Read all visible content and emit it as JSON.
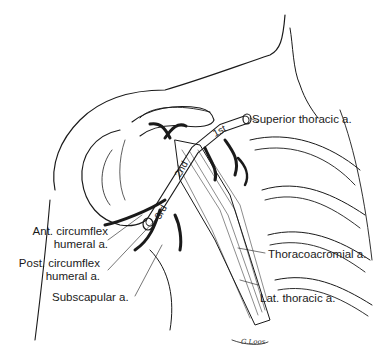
{
  "figure": {
    "labels": {
      "superior_thoracic": "Superior thoracic a.",
      "ant_circumflex_1": "Ant. circumflex",
      "ant_circumflex_2": "humeral a.",
      "post_circumflex_1": "Post. circumflex",
      "post_circumflex_2": "humeral a.",
      "subscapular": "Subscapular a.",
      "thoracoacromial": "Thoracoacromial a.",
      "lat_thoracic": "Lat. thoracic a."
    },
    "segments": {
      "first": "1st",
      "second": "2nd",
      "third": "3rd"
    },
    "signature": "G.Loos",
    "colors": {
      "ink": "#1a1a1a",
      "background": "#ffffff"
    }
  }
}
